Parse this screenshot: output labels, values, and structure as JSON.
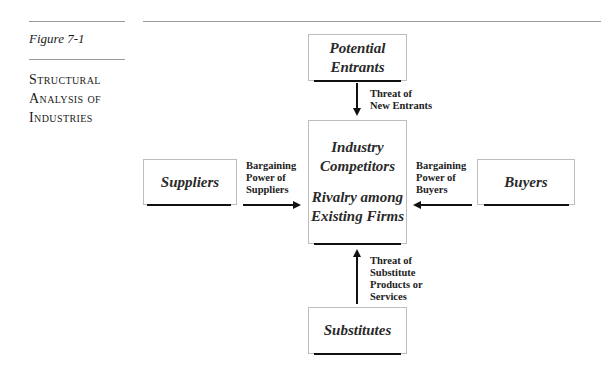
{
  "figure": {
    "number_label": "Figure 7-1",
    "title_lines": [
      "Structural",
      "Analysis of",
      "Industries"
    ]
  },
  "diagram": {
    "nodes": {
      "potential_entrants": {
        "lines": [
          "Potential",
          "Entrants"
        ]
      },
      "industry_competitors": {
        "lines": [
          "Industry",
          "Competitors"
        ],
        "sub_lines": [
          "Rivalry among",
          "Existing Firms"
        ]
      },
      "suppliers": {
        "lines": [
          "Suppliers"
        ]
      },
      "buyers": {
        "lines": [
          "Buyers"
        ]
      },
      "substitutes": {
        "lines": [
          "Substitutes"
        ]
      }
    },
    "edges": {
      "entrants_to_industry": {
        "label_lines": [
          "Threat of",
          "New Entrants"
        ],
        "direction": "down"
      },
      "suppliers_to_industry": {
        "label_lines": [
          "Bargaining",
          "Power of",
          "Suppliers"
        ],
        "direction": "right"
      },
      "buyers_to_industry": {
        "label_lines": [
          "Bargaining",
          "Power of",
          "Buyers"
        ],
        "direction": "left"
      },
      "substitutes_to_industry": {
        "label_lines": [
          "Threat of",
          "Substitute",
          "Products or",
          "Services"
        ],
        "direction": "up"
      }
    }
  },
  "colors": {
    "rule": "#9a9a9a",
    "box_border": "#bdbdbd",
    "arrow": "#111111"
  }
}
